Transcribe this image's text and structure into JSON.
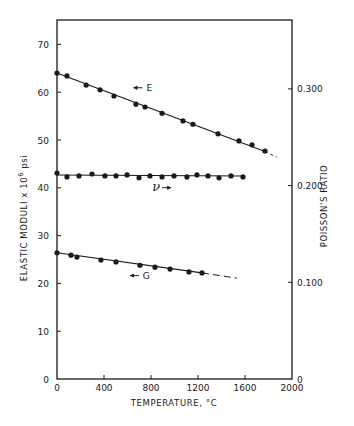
{
  "chart_data": {
    "type": "line",
    "title": "",
    "xlabel": "TEMPERATURE, °C",
    "ylabel": "ELASTIC MODULI x 10⁶ psi",
    "ylabel_right": "POISSON'S RATIO",
    "xlim": [
      0,
      2000
    ],
    "ylim": [
      0,
      75
    ],
    "ylim_right": [
      0,
      0.39
    ],
    "xticks": [
      0,
      400,
      800,
      1200,
      1600,
      2000
    ],
    "xtick_labels": [
      "0",
      "400",
      "800",
      "1200",
      "1600",
      "2000"
    ],
    "yticks": [
      0,
      10,
      20,
      30,
      40,
      50,
      60,
      70
    ],
    "ytick_labels": [
      "0",
      "10",
      "20",
      "30",
      "40",
      "50",
      "60",
      "70"
    ],
    "yticks_right": [
      0,
      0.1,
      0.2,
      0.3
    ],
    "ytick_labels_right": [
      "0",
      "0.100",
      "0.200",
      "0.300"
    ],
    "grid": false,
    "legend": "none (inline annotations)",
    "series": [
      {
        "name": "E",
        "annotation": "← E",
        "axis": "left",
        "marker": "filled-circle",
        "fit_line": {
          "x": [
            0,
            1770
          ],
          "y": [
            64.0,
            47.6
          ],
          "style": "solid"
        },
        "extension": {
          "x": [
            1770,
            1870
          ],
          "y": [
            47.6,
            46.4
          ],
          "style": "dashed"
        },
        "x": [
          0,
          85,
          248,
          366,
          485,
          672,
          749,
          894,
          1072,
          1157,
          1370,
          1549,
          1660,
          1770
        ],
        "y": [
          64.0,
          63.4,
          61.5,
          60.5,
          59.2,
          57.5,
          56.9,
          55.6,
          54.0,
          53.3,
          51.3,
          49.8,
          49.0,
          47.7
        ]
      },
      {
        "name": "ν",
        "annotation": "ν →",
        "axis": "right",
        "marker": "filled-circle",
        "fit_line": {
          "x": [
            0,
            1590
          ],
          "y": [
            0.211,
            0.21
          ],
          "style": "solid"
        },
        "x": [
          0,
          85,
          187,
          298,
          408,
          502,
          596,
          698,
          791,
          894,
          996,
          1106,
          1191,
          1285,
          1379,
          1481,
          1583
        ],
        "y": [
          0.213,
          0.209,
          0.21,
          0.212,
          0.21,
          0.21,
          0.211,
          0.208,
          0.21,
          0.209,
          0.21,
          0.209,
          0.211,
          0.21,
          0.208,
          0.21,
          0.209
        ]
      },
      {
        "name": "G",
        "annotation": "← G",
        "axis": "left",
        "marker": "filled-circle",
        "fit_line": {
          "x": [
            0,
            1234
          ],
          "y": [
            26.4,
            22.2
          ],
          "style": "solid"
        },
        "extension": {
          "x": [
            1234,
            1530
          ],
          "y": [
            22.2,
            21.1
          ],
          "style": "dashed"
        },
        "x": [
          0,
          119,
          170,
          374,
          502,
          706,
          834,
          962,
          1123,
          1234
        ],
        "y": [
          26.4,
          25.9,
          25.5,
          24.9,
          24.5,
          23.8,
          23.4,
          23.0,
          22.4,
          22.2
        ]
      }
    ],
    "annotations": [
      {
        "text": "← E",
        "x": 650,
        "y": 60.3
      },
      {
        "text": "ν →",
        "x": 810,
        "y": 39.5
      },
      {
        "text": "← G",
        "x": 620,
        "y": 21.0
      }
    ]
  }
}
